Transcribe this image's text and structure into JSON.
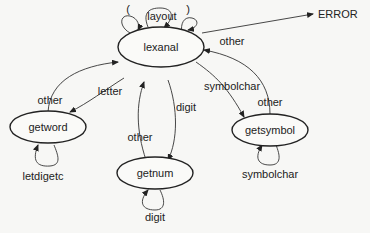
{
  "diagram": {
    "type": "state-transition",
    "nodes": {
      "lexanal": "lexanal",
      "getword": "getword",
      "getnum": "getnum",
      "getsymbol": "getsymbol",
      "error": "ERROR"
    },
    "edges": {
      "self_open_paren": "(",
      "self_layout": "layout",
      "self_close_paren": ")",
      "lexanal_to_error": "other",
      "getword_to_lexanal": "other",
      "lexanal_to_getword": "letter",
      "getword_self": "letdigetc",
      "lexanal_to_getnum": "digit",
      "getnum_to_lexanal": "other",
      "getnum_self": "digit",
      "lexanal_to_getsymbol": "symbolchar",
      "getsymbol_to_lexanal": "other",
      "getsymbol_self": "symbolchar"
    }
  }
}
